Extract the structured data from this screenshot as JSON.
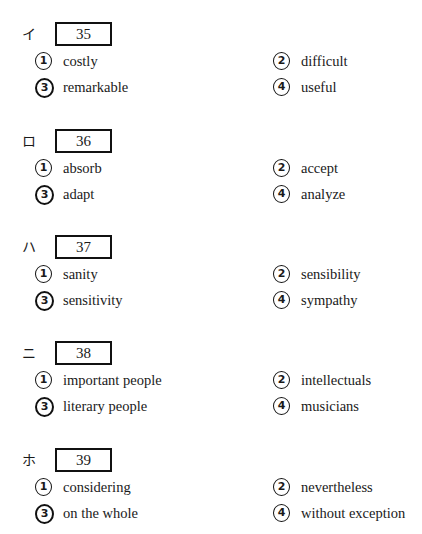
{
  "questions": [
    {
      "mark": "イ",
      "number": "35",
      "options": [
        {
          "num": "1",
          "text": "costly"
        },
        {
          "num": "2",
          "text": "difficult"
        },
        {
          "num": "3",
          "text": "remarkable"
        },
        {
          "num": "4",
          "text": "useful"
        }
      ]
    },
    {
      "mark": "ロ",
      "number": "36",
      "options": [
        {
          "num": "1",
          "text": "absorb"
        },
        {
          "num": "2",
          "text": "accept"
        },
        {
          "num": "3",
          "text": "adapt"
        },
        {
          "num": "4",
          "text": "analyze"
        }
      ]
    },
    {
      "mark": "ハ",
      "number": "37",
      "options": [
        {
          "num": "1",
          "text": "sanity"
        },
        {
          "num": "2",
          "text": "sensibility"
        },
        {
          "num": "3",
          "text": "sensitivity"
        },
        {
          "num": "4",
          "text": "sympathy"
        }
      ]
    },
    {
      "mark": "ニ",
      "number": "38",
      "options": [
        {
          "num": "1",
          "text": "important people"
        },
        {
          "num": "2",
          "text": "intellectuals"
        },
        {
          "num": "3",
          "text": "literary people"
        },
        {
          "num": "4",
          "text": "musicians"
        }
      ]
    },
    {
      "mark": "ホ",
      "number": "39",
      "options": [
        {
          "num": "1",
          "text": "considering"
        },
        {
          "num": "2",
          "text": "nevertheless"
        },
        {
          "num": "3",
          "text": "on the whole"
        },
        {
          "num": "4",
          "text": "without exception"
        }
      ]
    }
  ]
}
